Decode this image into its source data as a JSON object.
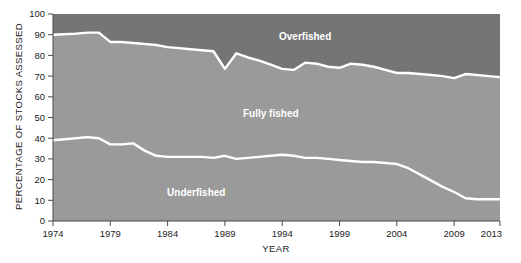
{
  "chart_data": {
    "type": "area",
    "title": "",
    "xlabel": "YEAR",
    "ylabel": "PERCENTAGE OF STOCKS ASSESSED",
    "stacked": true,
    "grid": false,
    "legend_position": "inline-labels",
    "xlim": [
      1974,
      2013
    ],
    "ylim": [
      0,
      100
    ],
    "xticks": [
      1974,
      1979,
      1984,
      1989,
      1994,
      1999,
      2004,
      2009,
      2013
    ],
    "xtick_labels": [
      "1974",
      "1979",
      "1984",
      "1989",
      "1994",
      "1999",
      "2004",
      "2009",
      "2013"
    ],
    "yticks": [
      0,
      10,
      20,
      30,
      40,
      50,
      60,
      70,
      80,
      90,
      100
    ],
    "ytick_labels": [
      "0",
      "10",
      "20",
      "30",
      "40",
      "50",
      "60",
      "70",
      "80",
      "90",
      "100"
    ],
    "x": [
      1974,
      1975,
      1976,
      1977,
      1978,
      1979,
      1980,
      1981,
      1982,
      1983,
      1984,
      1985,
      1986,
      1987,
      1988,
      1989,
      1990,
      1991,
      1992,
      1993,
      1994,
      1995,
      1996,
      1997,
      1998,
      1999,
      2000,
      2001,
      2002,
      2003,
      2004,
      2005,
      2006,
      2007,
      2008,
      2009,
      2010,
      2011,
      2012,
      2013
    ],
    "boundaries": {
      "underfished_top": [
        39,
        39.5,
        40,
        40.5,
        40,
        37,
        37,
        37.5,
        34,
        31.5,
        31,
        31,
        31,
        31,
        30.5,
        31.5,
        30,
        30.5,
        31,
        31.5,
        32,
        31.5,
        30.5,
        30.5,
        30,
        29.5,
        29,
        28.5,
        28.5,
        28,
        27.5,
        25.5,
        22.5,
        19.5,
        16.5,
        14,
        11,
        10.5,
        10.5,
        10.5
      ],
      "fully_fished_top": [
        90,
        90.2,
        90.5,
        91,
        91,
        86.5,
        86.5,
        86,
        85.5,
        85,
        84,
        83.5,
        83,
        82.5,
        82,
        73.5,
        81,
        79,
        77.5,
        75.5,
        73.5,
        73,
        76.5,
        76,
        74.5,
        74,
        76,
        75.5,
        74.5,
        73,
        71.5,
        71.5,
        71,
        70.5,
        70,
        69,
        71,
        70.5,
        70,
        69.5
      ]
    },
    "series": [
      {
        "name": "Underfished",
        "label_position": {
          "x": 1986.5,
          "y": 14
        },
        "color": "#9a9a9a",
        "values": [
          39,
          39.5,
          40,
          40.5,
          40,
          37,
          37,
          37.5,
          34,
          31.5,
          31,
          31,
          31,
          31,
          30.5,
          31.5,
          30,
          30.5,
          31,
          31.5,
          32,
          31.5,
          30.5,
          30.5,
          30,
          29.5,
          29,
          28.5,
          28.5,
          28,
          27.5,
          25.5,
          22.5,
          19.5,
          16.5,
          14,
          11,
          10.5,
          10.5,
          10.5
        ]
      },
      {
        "name": "Fully fished",
        "label_position": {
          "x": 1993,
          "y": 52
        },
        "color": "#9a9a9a",
        "values": [
          51,
          50.7,
          50.5,
          50.5,
          51,
          49.5,
          49.5,
          48.5,
          51.5,
          53.5,
          53,
          52.5,
          52,
          51.5,
          51.5,
          42,
          51,
          48.5,
          46.5,
          44,
          41.5,
          41.5,
          46,
          45.5,
          44.5,
          44.5,
          47,
          47,
          46,
          45,
          44,
          46,
          48.5,
          51,
          53.5,
          55,
          60,
          60,
          59.5,
          59
        ]
      },
      {
        "name": "Overfished",
        "label_position": {
          "x": 1996,
          "y": 89
        },
        "color": "#757575",
        "values": [
          10,
          9.8,
          9.5,
          9,
          9,
          13.5,
          13.5,
          14,
          14.5,
          15,
          16,
          16.5,
          17,
          17.5,
          18,
          26.5,
          19,
          21,
          22.5,
          24.5,
          26.5,
          27,
          23.5,
          24,
          25.5,
          26,
          24,
          24.5,
          25.5,
          27,
          28.5,
          28.5,
          29,
          29.5,
          30,
          31,
          29,
          29.5,
          30,
          30.5
        ]
      }
    ],
    "colors": {
      "overfished_band": "#757575",
      "fully_fished_band": "#9a9a9a",
      "underfished_band": "#9a9a9a",
      "boundary_line": "#ffffff",
      "text": "#1c1c1c",
      "page_background": "#ffffff"
    }
  }
}
